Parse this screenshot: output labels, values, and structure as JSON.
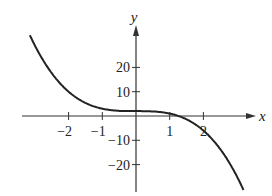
{
  "chart_data": {
    "type": "line",
    "title": "",
    "xlabel": "x",
    "ylabel": "y",
    "function": "y = 2 - x^3",
    "x_ticks": [
      -2,
      -1,
      1,
      2
    ],
    "x_tick_labels": [
      "−2",
      "−1",
      "1",
      "2"
    ],
    "y_ticks": [
      20,
      10,
      -10,
      -20
    ],
    "y_tick_labels": [
      "20",
      "10",
      "−10",
      "−20"
    ],
    "xlim": [
      -3.8,
      4.0
    ],
    "ylim": [
      -33,
      34
    ],
    "grid": false,
    "legend": null,
    "series": [
      {
        "name": "curve",
        "x": [
          -3.15,
          -3,
          -2.5,
          -2,
          -1.5,
          -1,
          -0.5,
          0,
          0.5,
          1,
          1.26,
          1.5,
          2,
          2.5,
          3,
          3.2
        ],
        "values": [
          33.3,
          29,
          17.6,
          10,
          5.4,
          3,
          2.1,
          2,
          1.9,
          1,
          0,
          -1.4,
          -6,
          -13.6,
          -25,
          -30.8
        ]
      }
    ]
  },
  "axes": {
    "x_label": "x",
    "y_label": "y"
  }
}
